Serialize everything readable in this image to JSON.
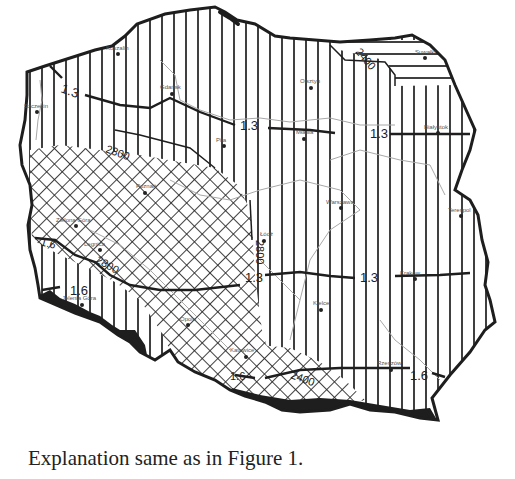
{
  "figure": {
    "caption": "Explanation same as in Figure 1.",
    "colors": {
      "background": "#ffffff",
      "ink": "#222222",
      "rivers": "#a8a8a8",
      "mountains_fill": "#1e1e1e"
    },
    "patterns": [
      {
        "name": "vertical-hatch",
        "description": "vertical line hatching covering most of the country"
      },
      {
        "name": "horizontal-hatch",
        "description": "horizontal line hatching in the north-east (Suwałki region)"
      },
      {
        "name": "cross-hatch",
        "description": "diamond cross-hatching in the west-central region and along the southern mountains"
      },
      {
        "name": "solid-black",
        "description": "solid black fill along the southern mountain border"
      }
    ],
    "isolines": {
      "labels": [
        "1.3",
        "1.3",
        "1.3",
        "1.3",
        "1.6",
        "1.6",
        "1.6",
        "2400",
        "2800",
        "2800",
        "2800",
        "1.6",
        "2400"
      ]
    },
    "iso_labels": {
      "north_13_west": "1.3",
      "north_13_center": "1.3",
      "north_13_east": "1.3",
      "central_13": "1.3",
      "central_13_east": "1.3",
      "west_16": "1.6",
      "south_16_west": "1.6",
      "south_16_east": "1.6",
      "ne_2400": "2400",
      "nw_2800": "2800",
      "center_2800": "2800",
      "west_2800": "2800",
      "west_16b": "1.6",
      "south_2400": "2400"
    },
    "cities": [
      {
        "name": "Koszalin"
      },
      {
        "name": "Gdańsk"
      },
      {
        "name": "Szczecin"
      },
      {
        "name": "Olsztyn"
      },
      {
        "name": "Suwałki"
      },
      {
        "name": "Piła"
      },
      {
        "name": "Mława"
      },
      {
        "name": "Białystok"
      },
      {
        "name": "Poznań"
      },
      {
        "name": "Warszawa"
      },
      {
        "name": "Łódź"
      },
      {
        "name": "Terespol"
      },
      {
        "name": "Zielona Góra"
      },
      {
        "name": "Legnica"
      },
      {
        "name": "Jelenia Góra"
      },
      {
        "name": "Opole"
      },
      {
        "name": "Kielce"
      },
      {
        "name": "Katowice"
      },
      {
        "name": "Kraków"
      },
      {
        "name": "Rzeszów"
      }
    ]
  }
}
